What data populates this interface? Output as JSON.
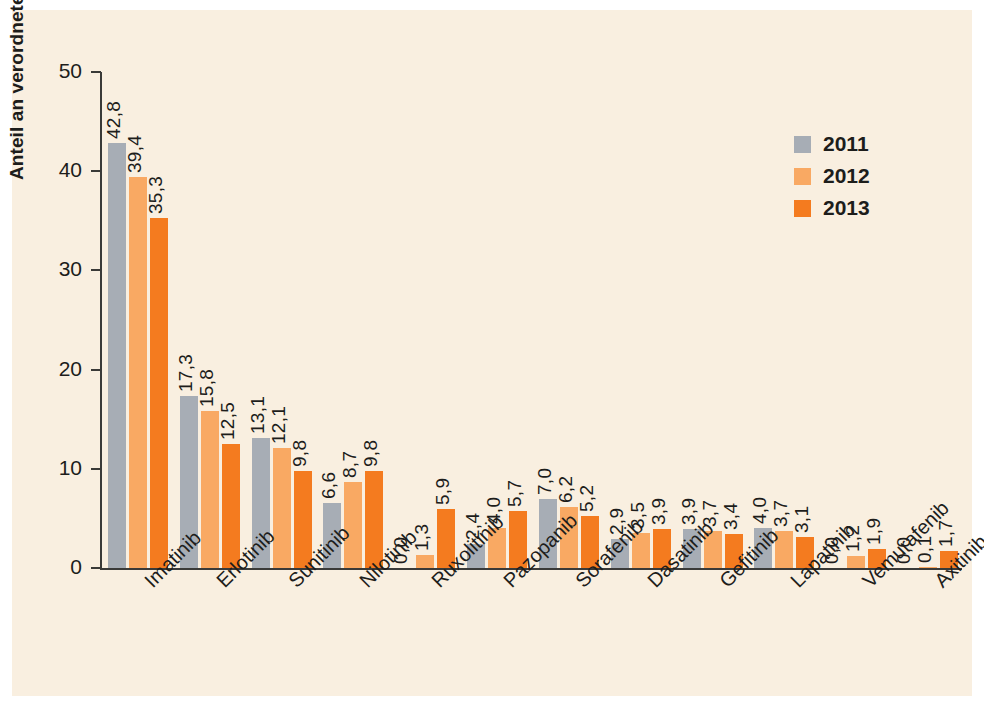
{
  "chart_data": {
    "type": "bar",
    "title": "",
    "xlabel": "",
    "ylabel": "Anteil an verordneten DDD (%)",
    "ylim": [
      0,
      50
    ],
    "yticks": [
      "0",
      "10",
      "20",
      "30",
      "40",
      "50"
    ],
    "grid": false,
    "legend_position": "top-right",
    "decimal_separator": ",",
    "categories": [
      "Imatinib",
      "Erlotinib",
      "Sunitinib",
      "Nilotinib",
      "Ruxolitinib",
      "Pazopanib",
      "Sorafenib",
      "Dasatinib",
      "Gefitinib",
      "Lapatinib",
      "Vemurafenib",
      "Axitinib"
    ],
    "series": [
      {
        "name": "2011",
        "color": "#a7adb5",
        "values": [
          42.8,
          17.3,
          13.1,
          6.6,
          0.0,
          2.4,
          7.0,
          2.9,
          3.9,
          4.0,
          0.0,
          0.0
        ],
        "labels": [
          "42,8",
          "17,3",
          "13,1",
          "6,6",
          "0,0",
          "2,4",
          "7,0",
          "2,9",
          "3,9",
          "4,0",
          "0,0",
          "0,0"
        ]
      },
      {
        "name": "2012",
        "color": "#f9a963",
        "values": [
          39.4,
          15.8,
          12.1,
          8.7,
          1.3,
          4.0,
          6.2,
          3.5,
          3.7,
          3.7,
          1.2,
          0.1
        ],
        "labels": [
          "39,4",
          "15,8",
          "12,1",
          "8,7",
          "1,3",
          "4,0",
          "6,2",
          "3,5",
          "3,7",
          "3,7",
          "1,2",
          "0,1"
        ]
      },
      {
        "name": "2013",
        "color": "#f47b1f",
        "values": [
          35.3,
          12.5,
          9.8,
          9.8,
          5.9,
          5.7,
          5.2,
          3.9,
          3.4,
          3.1,
          1.9,
          1.7
        ],
        "labels": [
          "35,3",
          "12,5",
          "9,8",
          "9,8",
          "5,9",
          "5,7",
          "5,2",
          "3,9",
          "3,4",
          "3,1",
          "1,9",
          "1,7"
        ]
      }
    ]
  },
  "legend": {
    "items": [
      {
        "label": "2011",
        "color": "#a7adb5"
      },
      {
        "label": "2012",
        "color": "#f9a963"
      },
      {
        "label": "2013",
        "color": "#f47b1f"
      }
    ]
  },
  "colors": {
    "panel_background": "#f9efe0",
    "axis": "#3a3a38",
    "text": "#1d1d1b",
    "series_2011": "#a7adb5",
    "series_2012": "#f9a963",
    "series_2013": "#f47b1f"
  }
}
